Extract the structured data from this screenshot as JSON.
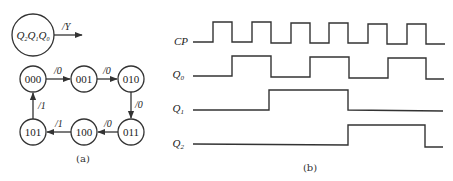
{
  "figure_a": {
    "caption": "(a)",
    "legend": {
      "state_label": "Q2Q1Q0",
      "output_label": "/Y"
    },
    "states": [
      {
        "id": "000",
        "label": "000"
      },
      {
        "id": "001",
        "label": "001"
      },
      {
        "id": "010",
        "label": "010"
      },
      {
        "id": "011",
        "label": "011"
      },
      {
        "id": "100",
        "label": "100"
      },
      {
        "id": "101",
        "label": "101"
      }
    ],
    "transitions": [
      {
        "from": "000",
        "to": "001",
        "label": "/0"
      },
      {
        "from": "001",
        "to": "010",
        "label": "/0"
      },
      {
        "from": "010",
        "to": "011",
        "label": "/0"
      },
      {
        "from": "011",
        "to": "100",
        "label": "/0"
      },
      {
        "from": "100",
        "to": "101",
        "label": "/1"
      },
      {
        "from": "101",
        "to": "000",
        "label": "/1"
      }
    ]
  },
  "figure_b": {
    "caption": "(b)",
    "signals": [
      {
        "name": "CP",
        "sub": ""
      },
      {
        "name": "Q",
        "sub": "0"
      },
      {
        "name": "Q",
        "sub": "1"
      },
      {
        "name": "Q",
        "sub": "2"
      }
    ],
    "waveforms": {
      "CP": [
        0,
        1,
        0,
        1,
        0,
        1,
        0,
        1,
        0,
        1,
        0,
        1,
        0
      ],
      "Q0": [
        0,
        0,
        1,
        1,
        0,
        0,
        1,
        1,
        0,
        0,
        1,
        1,
        0
      ],
      "Q1": [
        0,
        0,
        0,
        0,
        1,
        1,
        1,
        1,
        0,
        0,
        0,
        0,
        0
      ],
      "Q2": [
        0,
        0,
        0,
        0,
        0,
        0,
        0,
        0,
        1,
        1,
        1,
        1,
        0
      ]
    }
  }
}
